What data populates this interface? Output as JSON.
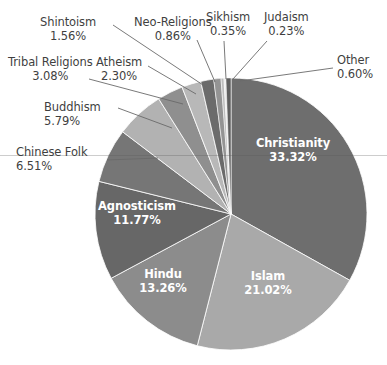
{
  "chart_data": {
    "type": "pie",
    "title": "",
    "subtitle": "",
    "xlabel": "",
    "ylabel": "",
    "units": "percent",
    "total": "100.00%",
    "legend_position": "none",
    "grid": false,
    "label_format": "name + percent",
    "start_angle_deg": 0,
    "direction": "clockwise",
    "categories": [
      "Christianity",
      "Islam",
      "Hindu",
      "Agnosticism",
      "Chinese Folk",
      "Buddhism",
      "Tribal Religions",
      "Atheism",
      "Neo-Religions",
      "Sikhism",
      "Judaism",
      "Other"
    ],
    "values": [
      33.32,
      21.02,
      13.26,
      11.77,
      6.51,
      5.79,
      3.08,
      2.3,
      0.86,
      0.35,
      0.23,
      0.6
    ],
    "slices": [
      {
        "name": "Christianity",
        "value": 33.32,
        "value_text": "33.32%",
        "color": "#6e6e6e",
        "label_placement": "inside",
        "label_x": 293,
        "label_y": 150,
        "leader": false
      },
      {
        "name": "Islam",
        "value": 21.02,
        "value_text": "21.02%",
        "color": "#a9a9a9",
        "label_placement": "inside",
        "label_x": 268,
        "label_y": 283,
        "leader": false
      },
      {
        "name": "Hindu",
        "value": 13.26,
        "value_text": "13.26%",
        "color": "#8c8c8c",
        "label_placement": "inside",
        "label_x": 163,
        "label_y": 281,
        "leader": false
      },
      {
        "name": "Agnosticism",
        "value": 11.77,
        "value_text": "11.77%",
        "color": "#676767",
        "label_placement": "inside",
        "label_x": 137,
        "label_y": 213,
        "leader": false
      },
      {
        "name": "Chinese Folk",
        "value": 6.51,
        "value_text": "6.51%",
        "color": "#767676",
        "label_placement": "outside",
        "label_x": 16,
        "label_y": 146,
        "align": "left",
        "leader": true,
        "leader_from_x": 107,
        "leader_from_y": 160,
        "leader_to_x": 158,
        "leader_to_y": 158
      },
      {
        "name": "Buddhism",
        "value": 5.79,
        "value_text": "5.79%",
        "color": "#b2b2b2",
        "label_placement": "outside",
        "label_x": 44,
        "label_y": 101,
        "align": "left",
        "leader": true,
        "leader_from_x": 118,
        "leader_from_y": 108,
        "leader_to_x": 172,
        "leader_to_y": 128
      },
      {
        "name": "Tribal Religions",
        "value": 3.08,
        "value_text": "3.08%",
        "color": "#8f8f8f",
        "label_placement": "outside",
        "label_x": 8,
        "label_y": 56,
        "align": "center",
        "leader": true,
        "leader_from_x": 89,
        "leader_from_y": 79,
        "leader_to_x": 183,
        "leader_to_y": 104
      },
      {
        "name": "Atheism",
        "value": 2.3,
        "value_text": "2.30%",
        "color": "#b8b8b8",
        "label_placement": "outside",
        "label_x": 96,
        "label_y": 56,
        "align": "center",
        "leader": true,
        "leader_from_x": 148,
        "leader_from_y": 66,
        "leader_to_x": 196,
        "leader_to_y": 94
      },
      {
        "name": "Shintoism",
        "value": 1.56,
        "value_text": "1.56%",
        "color": "#6b6b6b",
        "label_placement": "outside",
        "label_x": 40,
        "label_y": 16,
        "align": "center",
        "leader": true,
        "leader_from_x": 113,
        "leader_from_y": 25,
        "leader_to_x": 206,
        "leader_to_y": 87
      },
      {
        "name": "Neo-Religions",
        "value": 0.86,
        "value_text": "0.86%",
        "color": "#949494",
        "label_placement": "outside",
        "label_x": 134,
        "label_y": 16,
        "align": "center",
        "leader": true,
        "leader_from_x": 197,
        "leader_from_y": 40,
        "leader_to_x": 215,
        "leader_to_y": 82
      },
      {
        "name": "Sikhism",
        "value": 0.35,
        "value_text": "0.35%",
        "color": "#bdbdbd",
        "label_placement": "outside",
        "label_x": 206,
        "label_y": 11,
        "align": "center",
        "leader": true,
        "leader_from_x": 224,
        "leader_from_y": 41,
        "leader_to_x": 226,
        "leader_to_y": 79
      },
      {
        "name": "Judaism",
        "value": 0.23,
        "value_text": "0.23%",
        "color": "#e8e8e8",
        "label_placement": "outside",
        "label_x": 264,
        "label_y": 11,
        "align": "center",
        "leader": true,
        "leader_from_x": 267,
        "leader_from_y": 41,
        "leader_to_x": 233,
        "leader_to_y": 79
      },
      {
        "name": "Other",
        "value": 0.6,
        "value_text": "0.60%",
        "color": "#5f5f5f",
        "label_placement": "outside",
        "label_x": 337,
        "label_y": 54,
        "align": "left",
        "leader": true,
        "leader_from_x": 333,
        "leader_from_y": 68,
        "leader_to_x": 240,
        "leader_to_y": 81
      }
    ],
    "geometry": {
      "center_x": 231,
      "center_y": 214,
      "radius": 136
    },
    "colors": {
      "background": "#ffffff",
      "label_text": "#3f3f3f",
      "inside_label_text": "#ffffff",
      "leader_line": "#6a6a6a",
      "slice_outline": "#ffffff"
    }
  }
}
